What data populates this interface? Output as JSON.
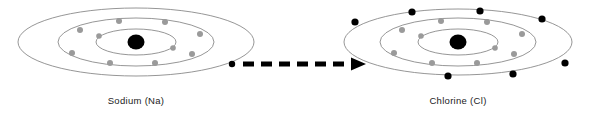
{
  "figure": {
    "background_color": "#ffffff",
    "width": 604,
    "height": 117
  },
  "colors": {
    "orbit_stroke": "#8a8a8a",
    "nucleus_fill": "#000000",
    "electron_gray": "#9a9a9a",
    "electron_black": "#000000",
    "arrow": "#000000",
    "label_text": "#222222"
  },
  "atoms": [
    {
      "id": "sodium",
      "label": "Sodium (Na)",
      "label_x": 136,
      "label_y": 104,
      "nucleus": {
        "cx": 136,
        "cy": 42,
        "rx": 8.5,
        "ry": 7.5
      },
      "shells": [
        {
          "name": "shell-1",
          "rx": 40,
          "ry": 13,
          "electron_count": 2,
          "electron_color": "gray"
        },
        {
          "name": "shell-2",
          "rx": 78,
          "ry": 24,
          "electron_count": 8,
          "electron_color": "gray"
        },
        {
          "name": "shell-3",
          "rx": 118,
          "ry": 34,
          "electron_count": 1,
          "electron_color": "black"
        }
      ],
      "electrons": [
        {
          "shell": 1,
          "cx": 99,
          "cy": 36,
          "color": "gray",
          "r": 2.8
        },
        {
          "shell": 1,
          "cx": 173,
          "cy": 48,
          "color": "gray",
          "r": 2.8
        },
        {
          "shell": 2,
          "cx": 80,
          "cy": 30,
          "color": "gray",
          "r": 3.0
        },
        {
          "shell": 2,
          "cx": 119,
          "cy": 21,
          "color": "gray",
          "r": 3.0
        },
        {
          "shell": 2,
          "cx": 165,
          "cy": 22,
          "color": "gray",
          "r": 3.0
        },
        {
          "shell": 2,
          "cx": 200,
          "cy": 34,
          "color": "gray",
          "r": 3.0
        },
        {
          "shell": 2,
          "cx": 192,
          "cy": 54,
          "color": "gray",
          "r": 3.0
        },
        {
          "shell": 2,
          "cx": 155,
          "cy": 63,
          "color": "gray",
          "r": 3.0
        },
        {
          "shell": 2,
          "cx": 110,
          "cy": 63,
          "color": "gray",
          "r": 3.0
        },
        {
          "shell": 2,
          "cx": 72,
          "cy": 53,
          "color": "gray",
          "r": 3.0
        },
        {
          "shell": 3,
          "cx": 232,
          "cy": 64,
          "color": "black",
          "r": 3.2
        }
      ]
    },
    {
      "id": "chlorine",
      "label": "Chlorine (Cl)",
      "label_x": 458,
      "label_y": 104,
      "nucleus": {
        "cx": 458,
        "cy": 42,
        "rx": 8.5,
        "ry": 7.5
      },
      "shells": [
        {
          "name": "shell-1",
          "rx": 40,
          "ry": 13,
          "electron_count": 2,
          "electron_color": "gray"
        },
        {
          "name": "shell-2",
          "rx": 78,
          "ry": 24,
          "electron_count": 8,
          "electron_color": "gray"
        },
        {
          "name": "shell-3",
          "rx": 114,
          "ry": 33,
          "electron_count": 7,
          "electron_color": "black"
        }
      ],
      "electrons": [
        {
          "shell": 1,
          "cx": 421,
          "cy": 36,
          "color": "gray",
          "r": 2.8
        },
        {
          "shell": 1,
          "cx": 495,
          "cy": 48,
          "color": "gray",
          "r": 2.8
        },
        {
          "shell": 2,
          "cx": 402,
          "cy": 30,
          "color": "gray",
          "r": 3.0
        },
        {
          "shell": 2,
          "cx": 441,
          "cy": 21,
          "color": "gray",
          "r": 3.0
        },
        {
          "shell": 2,
          "cx": 487,
          "cy": 22,
          "color": "gray",
          "r": 3.0
        },
        {
          "shell": 2,
          "cx": 522,
          "cy": 34,
          "color": "gray",
          "r": 3.0
        },
        {
          "shell": 2,
          "cx": 514,
          "cy": 54,
          "color": "gray",
          "r": 3.0
        },
        {
          "shell": 2,
          "cx": 477,
          "cy": 63,
          "color": "gray",
          "r": 3.0
        },
        {
          "shell": 2,
          "cx": 432,
          "cy": 63,
          "color": "gray",
          "r": 3.0
        },
        {
          "shell": 2,
          "cx": 394,
          "cy": 53,
          "color": "gray",
          "r": 3.0
        },
        {
          "shell": 3,
          "cx": 355,
          "cy": 22,
          "color": "black",
          "r": 3.6
        },
        {
          "shell": 3,
          "cx": 412,
          "cy": 12,
          "color": "black",
          "r": 3.6
        },
        {
          "shell": 3,
          "cx": 480,
          "cy": 11,
          "color": "black",
          "r": 3.6
        },
        {
          "shell": 3,
          "cx": 542,
          "cy": 19,
          "color": "black",
          "r": 3.6
        },
        {
          "shell": 3,
          "cx": 565,
          "cy": 63,
          "color": "black",
          "r": 3.6
        },
        {
          "shell": 3,
          "cx": 513,
          "cy": 74,
          "color": "black",
          "r": 3.6
        },
        {
          "shell": 3,
          "cx": 448,
          "cy": 76,
          "color": "black",
          "r": 3.6
        }
      ]
    }
  ],
  "arrow": {
    "name": "electron-transfer-arrow",
    "start_dot": {
      "cx": 232,
      "cy": 64,
      "r": 3.2
    },
    "line_x1": 243,
    "line_x2": 352,
    "y": 64,
    "head_x": 365,
    "style": "dashed",
    "direction": "right"
  }
}
